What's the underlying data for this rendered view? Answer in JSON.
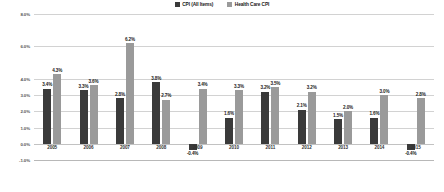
{
  "chart_data": {
    "type": "bar",
    "title": "",
    "xlabel": "",
    "ylabel": "",
    "ylim": [
      -1.0,
      8.0
    ],
    "ytick_labels": [
      "8.0%",
      "6.0%",
      "4.0%",
      "3.0%",
      "2.0%",
      "1.0%",
      "0.0%",
      "-1.0%"
    ],
    "ytick_values": [
      8.0,
      6.0,
      4.0,
      3.0,
      2.0,
      1.0,
      0.0,
      -1.0
    ],
    "grid": true,
    "legend_position": "top-center",
    "categories": [
      "2005",
      "2006",
      "2007",
      "2008",
      "2009",
      "2010",
      "2011",
      "2012",
      "2013",
      "2014",
      "2015"
    ],
    "series": [
      {
        "name": "CPI (All Items)",
        "color": "#3a3a3a",
        "values": [
          3.4,
          3.3,
          2.8,
          3.8,
          -0.4,
          1.6,
          3.2,
          2.1,
          1.5,
          1.6,
          -0.4
        ],
        "labels": [
          "3.4%",
          "3.3%",
          "2.8%",
          "3.8%",
          "-0.4%",
          "1.6%",
          "3.2%",
          "2.1%",
          "1.5%",
          "1.6%",
          "-0.4%"
        ]
      },
      {
        "name": "Health Care CPI",
        "color": "#9a9a9a",
        "values": [
          4.3,
          3.6,
          6.2,
          2.7,
          3.4,
          3.3,
          3.5,
          3.2,
          2.0,
          3.0,
          2.8
        ],
        "labels": [
          "4.3%",
          "3.6%",
          "6.2%",
          "2.7%",
          "3.4%",
          "3.3%",
          "3.5%",
          "3.2%",
          "2.0%",
          "3.0%",
          "2.8%"
        ]
      }
    ]
  },
  "legend": {
    "items": [
      {
        "label": "CPI (All Items)"
      },
      {
        "label": "Health Care CPI"
      }
    ]
  }
}
